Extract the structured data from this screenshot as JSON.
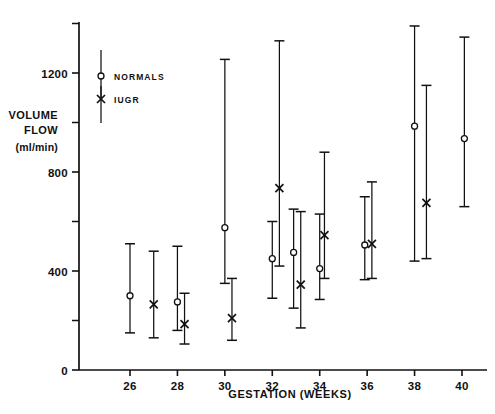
{
  "chart_data": {
    "type": "scatter",
    "title": "",
    "xlabel": "GESTATION (WEEKS)",
    "ylabel_line1": "VOLUME",
    "ylabel_line2": "FLOW",
    "ylabel_units": "(ml/min)",
    "xlim": [
      24.2,
      41.4
    ],
    "ylim": [
      0,
      1430
    ],
    "grid": false,
    "legend_position": "upper-left-inside",
    "x_ticks_major": [
      26,
      28,
      30,
      32,
      34,
      36,
      38,
      40
    ],
    "x_tick_labels": [
      "26",
      "28",
      "30",
      "32",
      "34",
      "36",
      "38",
      "40"
    ],
    "y_ticks_major": [
      0,
      400,
      800,
      1200
    ],
    "y_tick_labels": [
      "0",
      "400",
      "800",
      "1200"
    ],
    "y_ticks_minor": [
      200,
      600,
      1000,
      1400
    ],
    "error_bar_type": "range (mean with vertical range bars, capped)",
    "legend": [
      {
        "name": "NORMALS",
        "marker": "circle-open"
      },
      {
        "name": "IUGR",
        "marker": "cross-x"
      }
    ],
    "series": [
      {
        "name": "NORMALS",
        "marker": "circle-open",
        "points": [
          {
            "x": 26.0,
            "y": 300,
            "low": 150,
            "high": 510
          },
          {
            "x": 28.0,
            "y": 275,
            "low": 160,
            "high": 500
          },
          {
            "x": 30.0,
            "y": 575,
            "low": 350,
            "high": 1255
          },
          {
            "x": 32.0,
            "y": 450,
            "low": 290,
            "high": 600
          },
          {
            "x": 32.9,
            "y": 475,
            "low": 250,
            "high": 650
          },
          {
            "x": 34.0,
            "y": 410,
            "low": 285,
            "high": 630
          },
          {
            "x": 35.9,
            "y": 505,
            "low": 365,
            "high": 700
          },
          {
            "x": 38.0,
            "y": 985,
            "low": 440,
            "high": 1390
          },
          {
            "x": 40.1,
            "y": 935,
            "low": 660,
            "high": 1345
          }
        ]
      },
      {
        "name": "IUGR",
        "marker": "cross-x",
        "points": [
          {
            "x": 27.0,
            "y": 265,
            "low": 130,
            "high": 480
          },
          {
            "x": 28.3,
            "y": 185,
            "low": 105,
            "high": 310
          },
          {
            "x": 30.3,
            "y": 210,
            "low": 120,
            "high": 370
          },
          {
            "x": 32.3,
            "y": 735,
            "low": 420,
            "high": 1330
          },
          {
            "x": 33.2,
            "y": 345,
            "low": 170,
            "high": 640
          },
          {
            "x": 34.2,
            "y": 545,
            "low": 370,
            "high": 880
          },
          {
            "x": 36.2,
            "y": 510,
            "low": 370,
            "high": 760
          },
          {
            "x": 38.5,
            "y": 675,
            "low": 450,
            "high": 1150
          }
        ]
      }
    ]
  }
}
